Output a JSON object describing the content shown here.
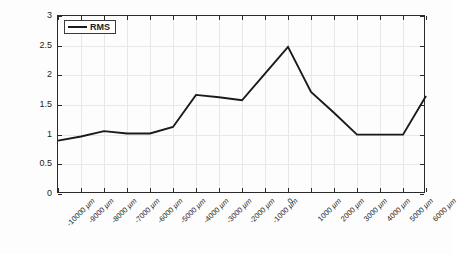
{
  "chart_data": {
    "type": "line",
    "title": "",
    "xlabel": "",
    "ylabel": "",
    "ylim": [
      0,
      3
    ],
    "yticks": [
      "0",
      "0.5",
      "1",
      "1.5",
      "2",
      "2.5",
      "3"
    ],
    "ytick_values": [
      0,
      0.5,
      1,
      1.5,
      2,
      2.5,
      3
    ],
    "grid": true,
    "legend_position": "top-left",
    "categories": [
      "-10000 µm",
      "-9000 µm",
      "-8000 µm",
      "-7000 µm",
      "-6000 µm",
      "-5000 µm",
      "-4000 µm",
      "-3000 µm",
      "-2000 µm",
      "-1000 µm",
      "0",
      "1000 µm",
      "2000 µm",
      "3000 µm",
      "4000 µm",
      "5000 µm",
      "6000 µm"
    ],
    "x": [
      -10000,
      -9000,
      -8000,
      -7000,
      -6000,
      -5000,
      -4000,
      -3000,
      -2000,
      -1000,
      0,
      1000,
      2000,
      3000,
      4000,
      5000,
      6000
    ],
    "series": [
      {
        "name": "RMS",
        "color": "#1a1a1a",
        "values": [
          0.9,
          0.97,
          1.06,
          1.02,
          1.02,
          1.13,
          1.67,
          1.63,
          1.58,
          2.03,
          2.48,
          1.72,
          1.37,
          1.0,
          1.0,
          1.0,
          1.65
        ]
      }
    ]
  },
  "legend": {
    "entries": [
      {
        "label": "RMS"
      }
    ]
  }
}
